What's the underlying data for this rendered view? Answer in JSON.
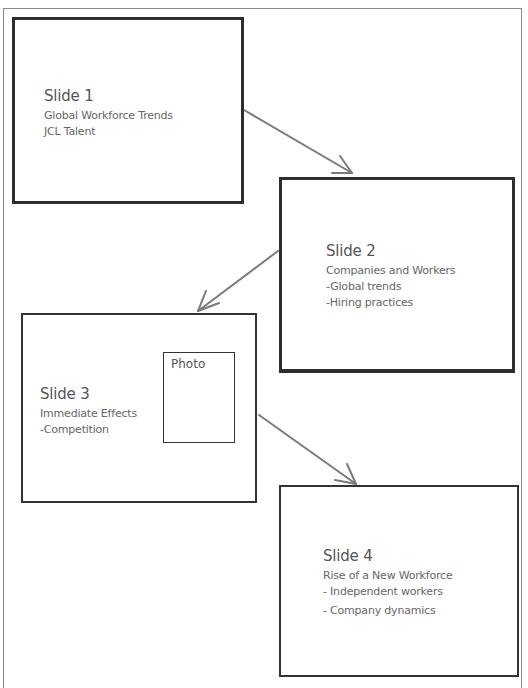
{
  "diagram": {
    "type": "storyboard-flow",
    "slides": [
      {
        "id": "slide-1",
        "title": "Slide 1",
        "lines": [
          "Global Workforce Trends",
          "JCL Talent"
        ]
      },
      {
        "id": "slide-2",
        "title": "Slide 2",
        "lines": [
          "Companies and Workers",
          "-Global trends",
          "-Hiring practices"
        ]
      },
      {
        "id": "slide-3",
        "title": "Slide 3",
        "lines": [
          "Immediate Effects",
          "-Competition"
        ],
        "placeholder": "Photo"
      },
      {
        "id": "slide-4",
        "title": "Slide 4",
        "lines": [
          "Rise of a New Workforce",
          "- Independent workers",
          "- Company dynamics"
        ]
      }
    ],
    "arrows": [
      {
        "from": "slide-1",
        "to": "slide-2"
      },
      {
        "from": "slide-2",
        "to": "slide-3"
      },
      {
        "from": "slide-3",
        "to": "slide-4"
      }
    ],
    "colors": {
      "box_border": "#2e2e2e",
      "arrow": "#7a7a7a",
      "text": "#555555",
      "frame": "#8a8a8a"
    }
  }
}
